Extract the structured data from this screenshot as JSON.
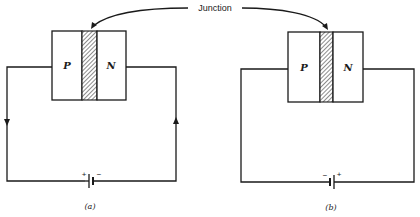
{
  "figure": {
    "junction_label": "Junction",
    "colors": {
      "ink": "#1a1a1a",
      "background": "#ffffff"
    },
    "panels": [
      {
        "id": "a",
        "caption": "(a)",
        "p_label": "P",
        "n_label": "N",
        "battery": {
          "left_sign": "+",
          "right_sign": "−"
        },
        "current_arrows": [
          "down-left-wire",
          "up-right-wire"
        ]
      },
      {
        "id": "b",
        "caption": "(b)",
        "p_label": "P",
        "n_label": "N",
        "battery": {
          "left_sign": "−",
          "right_sign": "+"
        },
        "current_arrows": []
      }
    ]
  }
}
